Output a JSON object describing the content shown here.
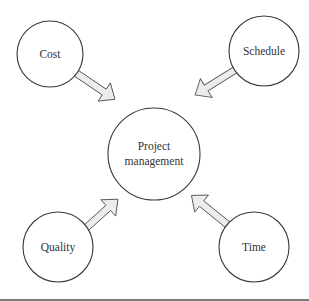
{
  "diagram": {
    "center": {
      "label_lines": [
        "Project",
        "management"
      ]
    },
    "nodes": [
      {
        "label": "Cost"
      },
      {
        "label": "Schedule"
      },
      {
        "label": "Quality"
      },
      {
        "label": "Time"
      }
    ]
  }
}
